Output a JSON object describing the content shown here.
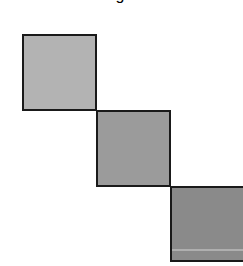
{
  "diagram": {
    "title_fragment": "g",
    "squares": [
      {
        "label": "",
        "color": "#b3b3b3"
      },
      {
        "label": "",
        "color": "#9b9b9b"
      },
      {
        "label": "",
        "color": "#8a8a8a"
      }
    ]
  }
}
